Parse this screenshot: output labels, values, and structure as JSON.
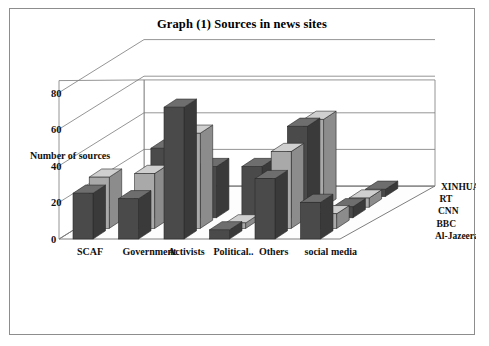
{
  "figure": {
    "title": "Graph (1) Sources in news sites",
    "border_color": "#8d8d8d",
    "background": "#ffffff"
  },
  "axes": {
    "ylabel": "Number of sources",
    "yticks": [
      "0",
      "20",
      "40",
      "60",
      "80"
    ],
    "ymin": 0,
    "ymax": 80
  },
  "legend": {
    "position": "right-depth-axis",
    "items": [
      {
        "label": "XINHUA"
      },
      {
        "label": "RT"
      },
      {
        "label": "CNN"
      },
      {
        "label": "BBC"
      },
      {
        "label": "Al-Jazeera"
      }
    ]
  },
  "colors": {
    "dark_series": "#4a4a4a",
    "light_series": "#a9a9a9",
    "dark_top": "#6e6e6e",
    "light_top": "#cfcfcf",
    "dark_side": "#3a3a3a",
    "light_side": "#8c8c8c",
    "grid": "#7a7a7a"
  },
  "chart_data": {
    "type": "bar",
    "title": "Graph (1) Sources in news sites",
    "xlabel": "",
    "ylabel": "Number of sources",
    "ylim": [
      0,
      80
    ],
    "grid": true,
    "legend_position": "right",
    "three_d": true,
    "categories": [
      "SCAF",
      "Government",
      "Activists",
      "Political..",
      "Others",
      "social media"
    ],
    "series": [
      {
        "name": "Al-Jazeera",
        "color": "#4a4a4a",
        "values": [
          25,
          22,
          72,
          5,
          33,
          20
        ]
      },
      {
        "name": "BBC",
        "color": "#a9a9a9",
        "values": [
          28,
          30,
          52,
          3,
          42,
          8
        ]
      },
      {
        "name": "CNN",
        "color": "#4a4a4a",
        "values": [
          0,
          38,
          28,
          28,
          50,
          6
        ]
      },
      {
        "name": "RT",
        "color": "#a9a9a9",
        "values": [
          0,
          0,
          0,
          12,
          48,
          5
        ]
      },
      {
        "name": "XINHUA",
        "color": "#4a4a4a",
        "values": [
          0,
          0,
          0,
          18,
          0,
          4
        ]
      }
    ]
  }
}
